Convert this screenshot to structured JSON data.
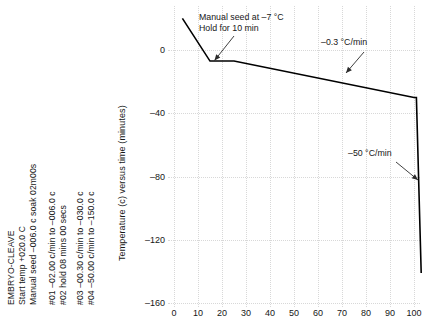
{
  "program": {
    "lines": [
      "EMBRYO-CLEAVE",
      "Start temp +020.0 C",
      "Manual seed –006.0 c soak 02m00s",
      "#01 –02.00 c/min to –006.0 c",
      "#02 hold 08 mins 00 secs",
      "#03 –00.30 c/min to –030.0 c",
      "#04 –50.00 c/min to –150.0 c"
    ]
  },
  "chart_data": {
    "type": "line",
    "title": "",
    "xlabel": "",
    "ylabel": "Temperature (c) versus time (minutes)",
    "xlim": [
      0,
      105
    ],
    "ylim": [
      -160,
      20
    ],
    "xticks": [
      0,
      10,
      20,
      30,
      40,
      50,
      60,
      70,
      80,
      90,
      100
    ],
    "yticks": [
      0,
      -40,
      -80,
      -120,
      -160
    ],
    "xtick_labels": [
      "0",
      "10",
      "20",
      "30",
      "40",
      "50",
      "60",
      "70",
      "80",
      "90",
      "100"
    ],
    "ytick_labels": [
      "0",
      "–40",
      "–80",
      "–120",
      "–160"
    ],
    "grid": true,
    "legend": false,
    "line_color": "#000000",
    "series": [
      {
        "name": "Cooling profile",
        "x": [
          3.5,
          15,
          25,
          100,
          101,
          103
        ],
        "y": [
          20,
          -7,
          -7,
          -30,
          -30,
          -141
        ]
      }
    ],
    "annotations": [
      {
        "name": "manual-seed",
        "text_lines": [
          "Manual seed at –7 °C",
          "Hold for 10 min"
        ],
        "point": [
          15,
          -7
        ]
      },
      {
        "name": "rate-slow",
        "text_lines": [
          "–0.3 °C/min"
        ],
        "point": [
          52,
          -19
        ]
      },
      {
        "name": "rate-fast",
        "text_lines": [
          "–50 °C/min"
        ],
        "point": [
          101,
          -90
        ]
      }
    ]
  }
}
